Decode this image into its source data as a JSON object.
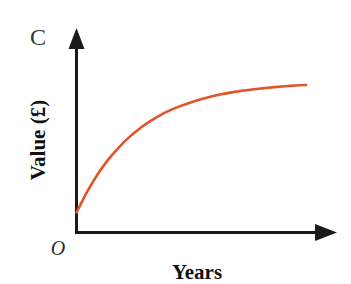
{
  "figure": {
    "part_label": "C",
    "background_color": "#ffffff",
    "width": 351,
    "height": 284
  },
  "axes": {
    "color": "#1a1a1a",
    "line_width": 3,
    "origin_label": "O",
    "x_axis": {
      "title": "Years",
      "arrow": "arrowhead-right"
    },
    "y_axis": {
      "title": "Value (£)",
      "arrow": "arrowhead-up"
    }
  },
  "chart_data": {
    "type": "line",
    "title": "",
    "subtitle": "",
    "xlabel": "Years",
    "ylabel": "Value (£)",
    "annotations": [
      "C",
      "O"
    ],
    "legend": [],
    "legend_position": "none",
    "grid": false,
    "axis_ticks": false,
    "tick_labels": {
      "x": [],
      "y": []
    },
    "xlim": [
      0,
      11
    ],
    "ylim": [
      0,
      10
    ],
    "series": [
      {
        "name": "Value of investment",
        "color": "#e0542a",
        "line_width": 2.6,
        "shape": "bounded exponential growth approaching an asymptote",
        "equation": "y = 8.75 - 7.6 * exp(-x / 2.85)",
        "x": [
          0,
          0.5,
          1,
          1.5,
          2,
          2.5,
          3,
          3.5,
          4,
          4.5,
          5,
          5.5,
          6,
          6.5,
          7,
          7.5,
          8,
          8.5,
          9,
          9.5,
          10,
          10.5,
          11
        ],
        "values": [
          1.15,
          2.33,
          3.33,
          4.17,
          4.87,
          5.47,
          5.97,
          6.39,
          6.75,
          7.05,
          7.3,
          7.51,
          7.69,
          7.85,
          7.98,
          8.09,
          8.18,
          8.26,
          8.32,
          8.38,
          8.43,
          8.47,
          8.5
        ],
        "start_point": {
          "x": 0,
          "y": 1.15
        },
        "end_point": {
          "x": 11,
          "y": 8.5
        },
        "asymptote": 8.75
      }
    ]
  }
}
